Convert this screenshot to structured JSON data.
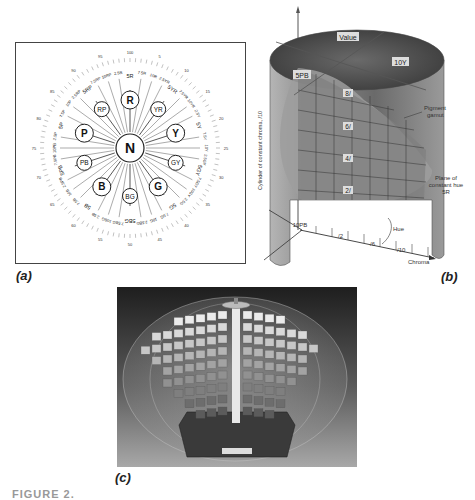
{
  "figure": {
    "caption_partial": "FIGURE 2.",
    "panels": {
      "a": {
        "label": "(a)",
        "center": "N",
        "principal_hues": [
          "R",
          "YR",
          "Y",
          "GY",
          "G",
          "BG",
          "B",
          "PB",
          "P",
          "RP"
        ],
        "hue_labels": [
          "5R",
          "7.5R",
          "10R",
          "2.5YR",
          "5YR",
          "7.5YR",
          "10YR",
          "2.5Y",
          "5Y",
          "7.5Y",
          "10Y",
          "2.5GY",
          "5GY",
          "7.5GY",
          "10GY",
          "2.5G",
          "5G",
          "7.5G",
          "10G",
          "2.5BG",
          "5BG",
          "7.5BG",
          "10BG",
          "2.5B",
          "5B",
          "7.5B",
          "10B",
          "2.5PB",
          "5PB",
          "7.5PB",
          "10PB",
          "2.5P",
          "5P",
          "7.5P",
          "10P",
          "2.5RP",
          "5RP",
          "7.5RP",
          "10RP",
          "2.5R"
        ],
        "outer_numbers": [
          "5",
          "10",
          "15",
          "20",
          "25",
          "30",
          "35",
          "40",
          "45",
          "50",
          "55",
          "60",
          "65",
          "70",
          "75",
          "80",
          "85",
          "90",
          "95",
          "100"
        ]
      },
      "b": {
        "label": "(b)",
        "axis_top": "Value",
        "hue_left": "5PB",
        "hue_right": "10Y",
        "value_labels": [
          "8/",
          "6/",
          "4/",
          "2/"
        ],
        "pigment_gamut": "Pigment gamut",
        "plane_label": "Plane of constant hue 5R",
        "cylinder_label": "Cylinder of constant chroma, /10",
        "hue_bottom": "10PB",
        "hue_arrow": "Hue",
        "chroma_ticks": [
          "/2",
          "/6",
          "/10"
        ],
        "chroma_axis": "Chroma"
      },
      "c": {
        "label": "(c)",
        "description": "Photograph of Munsell color tree",
        "plaque": "MUNSELL COLOR TREE"
      }
    },
    "colors": {
      "ink": "#222222",
      "cylinder_dark": "#4a4a4a",
      "cylinder_light": "#9a9a9a",
      "photo_bg": "#2a2a2a"
    }
  }
}
